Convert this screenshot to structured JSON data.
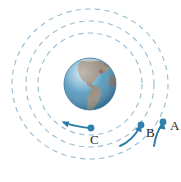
{
  "figure": {
    "background_color": "#ffffff",
    "width": 181,
    "height": 182
  },
  "earth": {
    "label": "Earth",
    "center_x": 90,
    "center_y": 84,
    "radius": 26,
    "ocean_color": "#6aa8c9",
    "ocean_color_dark": "#4a86a8",
    "land_color": "#9a8f80",
    "land_color_dark": "#7d7163",
    "highlight_color": "#b9dcec",
    "continents_shown": "Americas"
  },
  "orbits": [
    {
      "name": "orbit-inner",
      "for_point": "C",
      "radius_x": 52,
      "radius_y": 51,
      "stroke_color": "#8fb8cf"
    },
    {
      "name": "orbit-middle",
      "for_point": "B",
      "radius_x": 64,
      "radius_y": 63,
      "stroke_color": "#8fb8cf"
    },
    {
      "name": "orbit-outer",
      "for_point": "A",
      "radius_x": 78,
      "radius_y": 75,
      "stroke_color": "#8fb8cf"
    }
  ],
  "points": [
    {
      "label": "A",
      "dot_x": 163,
      "dot_y": 122,
      "label_x": 172,
      "label_y": 127,
      "orbit": "orbit-outer",
      "dot_color": "#2f82ab",
      "arrow_color": "#2b7ba3",
      "arrow_path": "M 154 146 Q 156 133 163 123",
      "arrow_head": "163,123 158.6,128.8 165.8,129.2"
    },
    {
      "label": "B",
      "dot_x": 141,
      "dot_y": 125,
      "label_x": 148,
      "label_y": 134,
      "orbit": "orbit-middle",
      "dot_color": "#2f82ab",
      "arrow_color": "#2b7ba3",
      "arrow_path": "M 120 146 Q 131 140 141 126",
      "arrow_head": "141,126 134.8,129.6 141.4,132.6"
    },
    {
      "label": "C",
      "dot_x": 91,
      "dot_y": 128,
      "label_x": 93,
      "label_y": 141,
      "orbit": "orbit-inner",
      "dot_color": "#2f82ab",
      "arrow_color": "#2b7ba3",
      "arrow_path": "M 91 128 Q 76 127 62 122",
      "arrow_head": "62,122 69.6,121.6 68.2,126.8"
    }
  ],
  "accent_colors": {
    "orbit_dash": "#8fb8cf",
    "satellite": "#2f82ab",
    "arrow": "#2b7ba3",
    "label_text": "#1c1c1c"
  }
}
